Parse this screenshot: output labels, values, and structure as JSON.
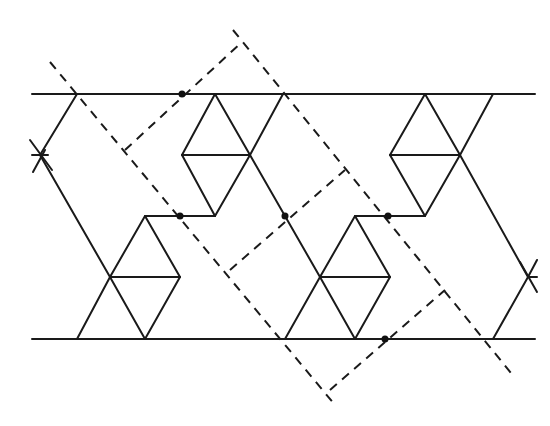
{
  "diagram": {
    "colors": {
      "line": "#1a1a1a",
      "background": "#ffffff",
      "dot": "#111111"
    },
    "band": {
      "top_line": [
        [
          32,
          94
        ],
        [
          535,
          94
        ]
      ],
      "bottom_line": [
        [
          32,
          339
        ],
        [
          535,
          339
        ]
      ]
    },
    "solid_segments": [
      [
        [
          77,
          94
        ],
        [
          40,
          155
        ]
      ],
      [
        [
          40,
          155
        ],
        [
          110,
          277
        ]
      ],
      [
        [
          110,
          277
        ],
        [
          77,
          339
        ]
      ],
      [
        [
          32,
          155
        ],
        [
          48,
          155
        ]
      ],
      [
        [
          30,
          140
        ],
        [
          52,
          170
        ]
      ],
      [
        [
          33,
          172
        ],
        [
          45,
          150
        ]
      ],
      [
        [
          145,
          216
        ],
        [
          110,
          277
        ]
      ],
      [
        [
          145,
          216
        ],
        [
          180,
          277
        ]
      ],
      [
        [
          180,
          277
        ],
        [
          145,
          339
        ]
      ],
      [
        [
          110,
          277
        ],
        [
          145,
          339
        ]
      ],
      [
        [
          110,
          277
        ],
        [
          180,
          277
        ]
      ],
      [
        [
          145,
          216
        ],
        [
          215,
          216
        ]
      ],
      [
        [
          215,
          94
        ],
        [
          182,
          155
        ]
      ],
      [
        [
          182,
          155
        ],
        [
          215,
          216
        ]
      ],
      [
        [
          215,
          94
        ],
        [
          250,
          155
        ]
      ],
      [
        [
          250,
          155
        ],
        [
          215,
          216
        ]
      ],
      [
        [
          182,
          155
        ],
        [
          250,
          155
        ]
      ],
      [
        [
          250,
          155
        ],
        [
          283,
          94
        ]
      ],
      [
        [
          250,
          155
        ],
        [
          320,
          277
        ]
      ],
      [
        [
          320,
          277
        ],
        [
          285,
          339
        ]
      ],
      [
        [
          355,
          216
        ],
        [
          320,
          277
        ]
      ],
      [
        [
          355,
          216
        ],
        [
          390,
          277
        ]
      ],
      [
        [
          390,
          277
        ],
        [
          355,
          339
        ]
      ],
      [
        [
          320,
          277
        ],
        [
          355,
          339
        ]
      ],
      [
        [
          320,
          277
        ],
        [
          390,
          277
        ]
      ],
      [
        [
          355,
          216
        ],
        [
          425,
          216
        ]
      ],
      [
        [
          425,
          94
        ],
        [
          390,
          155
        ]
      ],
      [
        [
          390,
          155
        ],
        [
          425,
          216
        ]
      ],
      [
        [
          425,
          94
        ],
        [
          460,
          155
        ]
      ],
      [
        [
          460,
          155
        ],
        [
          425,
          216
        ]
      ],
      [
        [
          390,
          155
        ],
        [
          460,
          155
        ]
      ],
      [
        [
          460,
          155
        ],
        [
          493,
          94
        ]
      ],
      [
        [
          460,
          155
        ],
        [
          528,
          277
        ]
      ],
      [
        [
          528,
          277
        ],
        [
          493,
          339
        ]
      ],
      [
        [
          528,
          277
        ],
        [
          537,
          277
        ]
      ],
      [
        [
          520,
          262
        ],
        [
          537,
          292
        ]
      ],
      [
        [
          537,
          260
        ],
        [
          528,
          277
        ]
      ]
    ],
    "dashed_segments": [
      [
        [
          50,
          62
        ],
        [
          335,
          405
        ]
      ],
      [
        [
          233,
          30
        ],
        [
          515,
          378
        ]
      ],
      [
        [
          125,
          150
        ],
        [
          242,
          42
        ]
      ],
      [
        [
          230,
          270
        ],
        [
          345,
          170
        ]
      ],
      [
        [
          330,
          390
        ],
        [
          445,
          290
        ]
      ]
    ],
    "points": [
      {
        "name": "point-a",
        "xy": [
          182,
          94
        ]
      },
      {
        "name": "point-b",
        "xy": [
          180,
          216
        ]
      },
      {
        "name": "point-c",
        "xy": [
          285,
          216
        ]
      },
      {
        "name": "point-d",
        "xy": [
          388,
          216
        ]
      },
      {
        "name": "point-e",
        "xy": [
          385,
          339
        ]
      }
    ]
  }
}
